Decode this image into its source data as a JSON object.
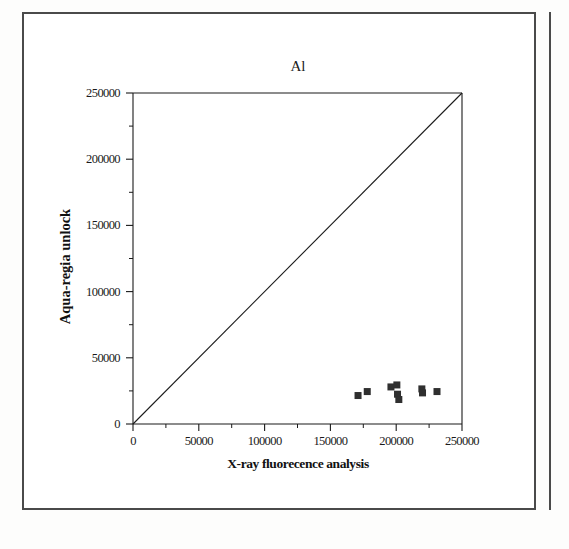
{
  "figure": {
    "title": "Al",
    "x_axis_title": "X-ray fluorecence analysis",
    "y_axis_title": "Aqua-regia unlock",
    "marker_color": "#2f2f2f",
    "axis_color": "#1a1a1a",
    "frame_color": "#4a4a4a"
  },
  "chart_data": {
    "type": "scatter",
    "title": "Al",
    "xlabel": "X-ray fluorecence analysis",
    "ylabel": "Aqua-regia unlock",
    "xlim": [
      0,
      250000
    ],
    "ylim": [
      0,
      250000
    ],
    "xticks": [
      0,
      50000,
      100000,
      150000,
      200000,
      250000
    ],
    "yticks": [
      0,
      50000,
      100000,
      150000,
      200000,
      250000
    ],
    "xtick_labels": [
      "0",
      "50000",
      "100000",
      "150000",
      "200000",
      "250000"
    ],
    "ytick_labels": [
      "0",
      "50000",
      "100000",
      "150000",
      "200000",
      "250000"
    ],
    "minor_ticks": true,
    "grid": false,
    "legend": null,
    "series": [
      {
        "name": "Al samples",
        "marker": "square",
        "color": "#2f2f2f",
        "points": [
          {
            "x": 171000,
            "y": 21500
          },
          {
            "x": 178000,
            "y": 24500
          },
          {
            "x": 196000,
            "y": 28000
          },
          {
            "x": 200500,
            "y": 29500
          },
          {
            "x": 201000,
            "y": 22500
          },
          {
            "x": 202000,
            "y": 18500
          },
          {
            "x": 219500,
            "y": 26500
          },
          {
            "x": 220000,
            "y": 23500
          },
          {
            "x": 231000,
            "y": 24500
          }
        ]
      }
    ],
    "reference_line": {
      "name": "1:1 line",
      "from": {
        "x": 0,
        "y": 0
      },
      "to": {
        "x": 250000,
        "y": 250000
      },
      "color": "#1a1a1a"
    }
  }
}
